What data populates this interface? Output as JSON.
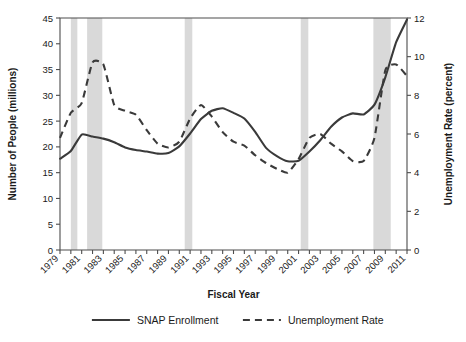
{
  "chart_data": {
    "type": "line",
    "title": "",
    "xlabel": "Fiscal Year",
    "ylabel": "Number of People (millions)",
    "y2label": "Unemployment Rate (percent)",
    "grid": false,
    "legend_position": "bottom",
    "xlim": [
      1979,
      2011
    ],
    "ylim": [
      0,
      45
    ],
    "y2lim": [
      0,
      12
    ],
    "x": [
      1979,
      1980,
      1981,
      1982,
      1983,
      1984,
      1985,
      1986,
      1987,
      1988,
      1989,
      1990,
      1991,
      1992,
      1993,
      1994,
      1995,
      1996,
      1997,
      1998,
      1999,
      2000,
      2001,
      2002,
      2003,
      2004,
      2005,
      2006,
      2007,
      2008,
      2009,
      2010,
      2011
    ],
    "x_tick_labels": [
      "1979",
      "1981",
      "1983",
      "1985",
      "1987",
      "1989",
      "1991",
      "1993",
      "1995",
      "1997",
      "1999",
      "2001",
      "2003",
      "2005",
      "2007",
      "2009",
      "2011"
    ],
    "y_tick_labels": [
      "0",
      "5",
      "10",
      "15",
      "20",
      "25",
      "30",
      "35",
      "40",
      "45"
    ],
    "y2_tick_labels": [
      "0",
      "2",
      "4",
      "6",
      "8",
      "10",
      "12"
    ],
    "series": [
      {
        "name": "SNAP Enrollment",
        "axis": "left",
        "style": "solid",
        "units": "millions",
        "values": [
          17.7,
          19.2,
          22.4,
          22.0,
          21.6,
          20.9,
          19.9,
          19.4,
          19.1,
          18.7,
          18.8,
          20.1,
          22.6,
          25.4,
          27.0,
          27.5,
          26.6,
          25.5,
          22.9,
          19.8,
          18.2,
          17.2,
          17.3,
          19.1,
          21.3,
          23.9,
          25.7,
          26.5,
          26.3,
          28.2,
          33.5,
          40.3,
          44.7
        ]
      },
      {
        "name": "Unemployment Rate",
        "axis": "right",
        "style": "dashed",
        "units": "percent",
        "values": [
          5.8,
          7.1,
          7.6,
          9.7,
          9.6,
          7.5,
          7.2,
          7.0,
          6.2,
          5.5,
          5.3,
          5.6,
          6.8,
          7.5,
          6.9,
          6.1,
          5.6,
          5.4,
          4.9,
          4.5,
          4.2,
          4.0,
          4.7,
          5.8,
          6.0,
          5.5,
          5.1,
          4.6,
          4.6,
          5.8,
          9.3,
          9.6,
          9.0
        ]
      }
    ],
    "recessions": [
      {
        "label": "1980 recession",
        "start": 1980.0,
        "end": 1980.6
      },
      {
        "label": "1981-1982 recession",
        "start": 1981.5,
        "end": 1982.9
      },
      {
        "label": "1990-1991 recession",
        "start": 1990.5,
        "end": 1991.2
      },
      {
        "label": "2001 recession",
        "start": 2001.2,
        "end": 2001.9
      },
      {
        "label": "2007-2009 recession",
        "start": 2007.9,
        "end": 2009.5
      }
    ]
  },
  "legend": {
    "items": [
      {
        "label": "SNAP Enrollment",
        "style": "solid"
      },
      {
        "label": "Unemployment Rate",
        "style": "dashed"
      }
    ]
  },
  "colors": {
    "line": "#3a3a3a",
    "recession_band": "#d9d9d9",
    "axis": "#4d4d4d",
    "background": "#ffffff"
  }
}
